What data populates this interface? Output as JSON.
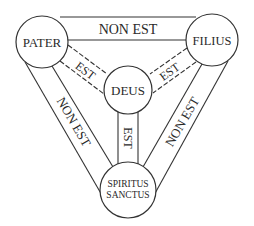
{
  "diagram": {
    "nodes": {
      "pater": "PATER",
      "filius": "FILIUS",
      "deus": "DEUS",
      "spiritus_line1": "SPIRITUS",
      "spiritus_line2": "SANCTUS"
    },
    "edges": {
      "pater_filius": "NON EST",
      "pater_spiritus": "NON EST",
      "filius_spiritus": "NON EST",
      "pater_deus": "EST",
      "filius_deus": "EST",
      "spiritus_deus": "EST"
    },
    "colors": {
      "stroke": "#333333",
      "text": "#2a2a2a",
      "background": "#ffffff"
    }
  }
}
